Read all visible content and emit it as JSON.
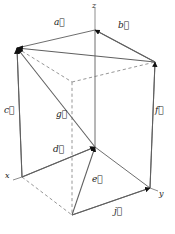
{
  "figure": {
    "background_color": "#ffffff",
    "line_color": "#6e6e6e",
    "dashed_color": "#8a8a8a",
    "arrow_color": "#111111",
    "label_color": "#1a1a1a",
    "axes": [
      {
        "name": "z",
        "label": "z",
        "x": 92,
        "y": 2
      },
      {
        "name": "x",
        "label": "x",
        "x": 5,
        "y": 172
      },
      {
        "name": "y",
        "label": "y",
        "x": 159,
        "y": 190
      }
    ],
    "vertices": {
      "z_top": {
        "x": 95,
        "y": 30
      },
      "top_left": {
        "x": 17,
        "y": 48
      },
      "top_right": {
        "x": 155,
        "y": 62
      },
      "top_back": {
        "x": 72,
        "y": 82
      },
      "x_origin": {
        "x": 22,
        "y": 177
      },
      "center": {
        "x": 95,
        "y": 147
      },
      "y_vertex": {
        "x": 150,
        "y": 188
      },
      "bottom_front": {
        "x": 72,
        "y": 215
      }
    },
    "vectors": [
      {
        "name": "a",
        "label": "a",
        "from": "top_right",
        "to": "top_left",
        "label_x": 54,
        "label_y": 18,
        "style": "solid"
      },
      {
        "name": "b",
        "label": "b",
        "from": "top_right",
        "to": "z_top",
        "label_x": 118,
        "label_y": 21,
        "style": "solid"
      },
      {
        "name": "c",
        "label": "c",
        "from": "x_origin",
        "to": "top_left",
        "label_x": 4,
        "label_y": 106,
        "style": "solid"
      },
      {
        "name": "d",
        "label": "d",
        "from": "x_origin",
        "to": "center",
        "label_x": 53,
        "label_y": 145,
        "style": "solid"
      },
      {
        "name": "e",
        "label": "e",
        "from": "bottom_front",
        "to": "center",
        "label_x": 92,
        "label_y": 175,
        "style": "solid"
      },
      {
        "name": "f",
        "label": "f",
        "from": "y_vertex",
        "to": "top_right",
        "label_x": 155,
        "label_y": 106,
        "style": "solid"
      },
      {
        "name": "g",
        "label": "g",
        "from": "center",
        "to": "top_left",
        "label_x": 56,
        "label_y": 110,
        "style": "solid"
      },
      {
        "name": "j",
        "label": "j",
        "from": "bottom_front",
        "to": "y_vertex",
        "label_x": 114,
        "label_y": 207,
        "style": "solid"
      }
    ],
    "edges_solid": [
      {
        "name": "edge-topleft-xorigin",
        "from": "top_left",
        "to": "x_origin"
      },
      {
        "name": "edge-topright-yvertex",
        "from": "top_right",
        "to": "y_vertex"
      },
      {
        "name": "edge-ztop-center",
        "from": "z_top",
        "to": "center"
      },
      {
        "name": "edge-center-yvertex",
        "from": "center",
        "to": "y_vertex"
      },
      {
        "name": "edge-xorigin-center",
        "from": "x_origin",
        "to": "center"
      },
      {
        "name": "edge-bottom-yvertex",
        "from": "bottom_front",
        "to": "y_vertex"
      },
      {
        "name": "edge-ztop-topleft",
        "from": "z_top",
        "to": "top_left"
      },
      {
        "name": "edge-ztop-topright",
        "from": "z_top",
        "to": "top_right"
      }
    ],
    "edges_dashed": [
      {
        "name": "dashed-topleft-topback",
        "from": "top_left",
        "to": "top_back"
      },
      {
        "name": "dashed-topback-topright",
        "from": "top_back",
        "to": "top_right"
      },
      {
        "name": "dashed-topback-bottomfront",
        "from": "top_back",
        "to": "bottom_front"
      },
      {
        "name": "dashed-xorigin-bottom",
        "from": "x_origin",
        "to": "bottom_front"
      }
    ],
    "axis_lines": [
      {
        "name": "z-axis-stub",
        "x1": 95,
        "y1": 8,
        "x2": 95,
        "y2": 30
      },
      {
        "name": "x-axis-stub",
        "x1": 22,
        "y1": 177,
        "x2": 13,
        "y2": 180
      },
      {
        "name": "y-axis-stub",
        "x1": 150,
        "y1": 188,
        "x2": 158,
        "y2": 191
      }
    ],
    "watermark_text": ""
  }
}
